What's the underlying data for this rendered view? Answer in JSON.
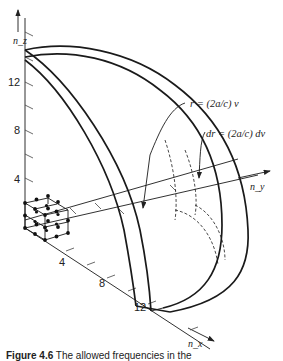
{
  "figure": {
    "axes": {
      "z_label": "n_z",
      "y_label": "n_y",
      "x_label": "n_x",
      "z_ticks": [
        "4",
        "8",
        "12"
      ],
      "x_ticks": [
        "4",
        "8",
        "12"
      ]
    },
    "annotations": {
      "radius": "r = (2a/c) ν",
      "shell_thickness": "dr = (2a/c) dν"
    },
    "caption": {
      "label": "Figure 4.6",
      "text": "The allowed frequencies in the"
    },
    "lattice": {
      "description": "cubic lattice of allowed modes near origin",
      "points_per_edge": 3
    }
  }
}
